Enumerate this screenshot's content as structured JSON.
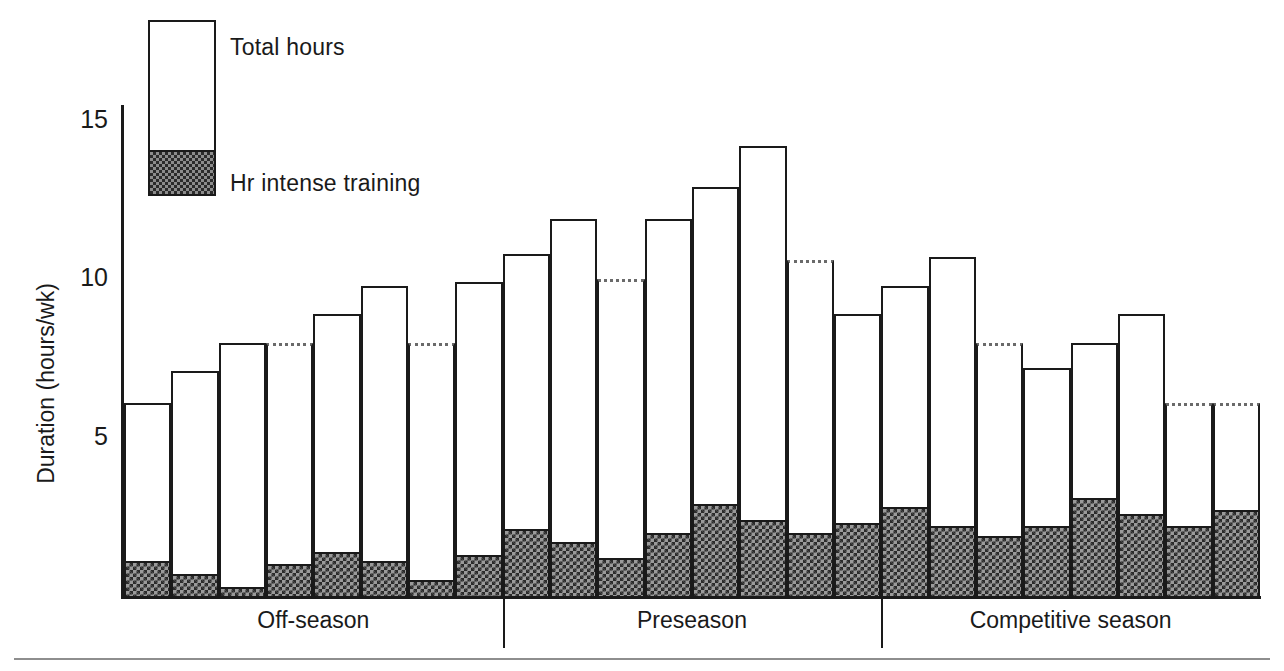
{
  "legend": {
    "total_label": "Total hours",
    "intense_label": "Hr intense training"
  },
  "axis": {
    "y_title": "Duration (hours/wk)",
    "y_ticks": [
      "15",
      "10",
      "5"
    ]
  },
  "groups": [
    {
      "label": "Off-season"
    },
    {
      "label": "Preseason"
    },
    {
      "label": "Competitive season"
    }
  ],
  "chart_data": {
    "type": "bar",
    "title": "",
    "xlabel": "",
    "ylabel": "Duration (hours/wk)",
    "ylim": [
      0,
      15.5
    ],
    "yticks": [
      5,
      10,
      15
    ],
    "grid": false,
    "legend_position": "top-left",
    "stacked": true,
    "note": "Each bar is one week. Dotted bar tops denote estimated/extrapolated values. Intense-training hours are the shaded bottom segment of each bar.",
    "categories": [
      "Off-season wk1",
      "Off-season wk2",
      "Off-season wk3",
      "Off-season wk4",
      "Off-season wk5",
      "Off-season wk6",
      "Off-season wk7",
      "Off-season wk8",
      "Preseason wk1",
      "Preseason wk2",
      "Preseason wk3",
      "Preseason wk4",
      "Preseason wk5",
      "Preseason wk6",
      "Preseason wk7",
      "Preseason wk8",
      "Competitive wk1",
      "Competitive wk2",
      "Competitive wk3",
      "Competitive wk4",
      "Competitive wk5",
      "Competitive wk6",
      "Competitive wk7",
      "Competitive wk8"
    ],
    "series": [
      {
        "name": "Total hours",
        "values": [
          6.1,
          7.1,
          8.0,
          8.0,
          8.9,
          9.8,
          8.0,
          9.9,
          10.8,
          11.9,
          10.0,
          11.9,
          12.9,
          14.2,
          10.6,
          8.9,
          9.8,
          10.7,
          8.0,
          7.2,
          8.0,
          8.9,
          6.1,
          6.1
        ]
      },
      {
        "name": "Hr intense training",
        "values": [
          1.1,
          0.7,
          0.3,
          1.0,
          1.4,
          1.1,
          0.5,
          1.3,
          2.1,
          1.7,
          1.2,
          2.0,
          2.9,
          2.4,
          2.0,
          2.3,
          2.8,
          2.2,
          1.9,
          2.2,
          3.1,
          2.6,
          2.2,
          2.7
        ]
      }
    ],
    "estimated_flags": [
      false,
      false,
      false,
      true,
      false,
      false,
      true,
      false,
      false,
      false,
      true,
      false,
      false,
      false,
      true,
      false,
      false,
      false,
      true,
      false,
      false,
      false,
      true,
      true
    ],
    "group_spans": [
      {
        "label": "Off-season",
        "start": 0,
        "end": 7
      },
      {
        "label": "Preseason",
        "start": 8,
        "end": 15
      },
      {
        "label": "Competitive season",
        "start": 16,
        "end": 23
      }
    ]
  }
}
